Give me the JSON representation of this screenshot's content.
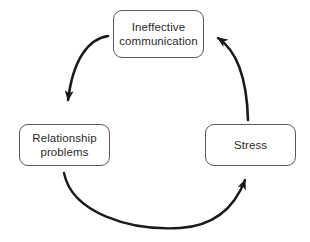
{
  "diagram": {
    "type": "cycle-flow-diagram",
    "title": "",
    "background_color": "#ffffff",
    "box_border_color": "#5a5a5a",
    "text_color": "#2b2b2b",
    "arrow_color": "#1a1a1a",
    "nodes": [
      {
        "id": "ineffective-communication",
        "label": "Ineffective\ncommunication",
        "position": "top"
      },
      {
        "id": "relationship-problems",
        "label": "Relationship\nproblems",
        "position": "left"
      },
      {
        "id": "stress",
        "label": "Stress",
        "position": "right"
      }
    ],
    "arrows": [
      {
        "id": "arrow-communication-to-relationship",
        "from": "ineffective-communication",
        "to": "relationship-problems",
        "direction": "clockwise-down-left"
      },
      {
        "id": "arrow-relationship-to-stress",
        "from": "relationship-problems",
        "to": "stress",
        "direction": "clockwise-bottom-right"
      },
      {
        "id": "arrow-stress-to-communication",
        "from": "stress",
        "to": "ineffective-communication",
        "direction": "clockwise-up-left"
      }
    ]
  }
}
